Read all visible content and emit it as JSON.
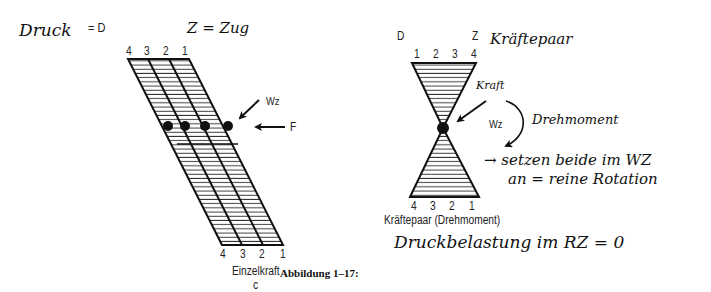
{
  "figure": {
    "caption": "Abbildung 1–17:",
    "left_panel": {
      "handwritten_druck": "Druck",
      "eq_d": "= D",
      "eq_z": "Z = Zug",
      "top_numbers": [
        "4",
        "3",
        "2",
        "1"
      ],
      "bottom_numbers": [
        "4",
        "3",
        "2",
        "1"
      ],
      "label_wz": "Wz",
      "label_f": "F",
      "subtitle": "Einzelkraft",
      "sublabel": "c"
    },
    "right_panel": {
      "label_d": "D",
      "label_z": "Z",
      "handwritten_title": "Kräftepaar",
      "top_numbers": [
        "1",
        "2",
        "3",
        "4"
      ],
      "bottom_numbers": [
        "4",
        "3",
        "2",
        "1"
      ],
      "handwritten_kraft": "Kraft",
      "label_wz": "Wz",
      "handwritten_drehmoment": "Drehmoment",
      "handwritten_note_line1": "→ setzen beide im WZ",
      "handwritten_note_line2": "an = reine Rotation",
      "subtitle": "Kräftepaar (Drehmoment)",
      "handwritten_bottom": "Druckbelastung im RZ = 0"
    }
  }
}
